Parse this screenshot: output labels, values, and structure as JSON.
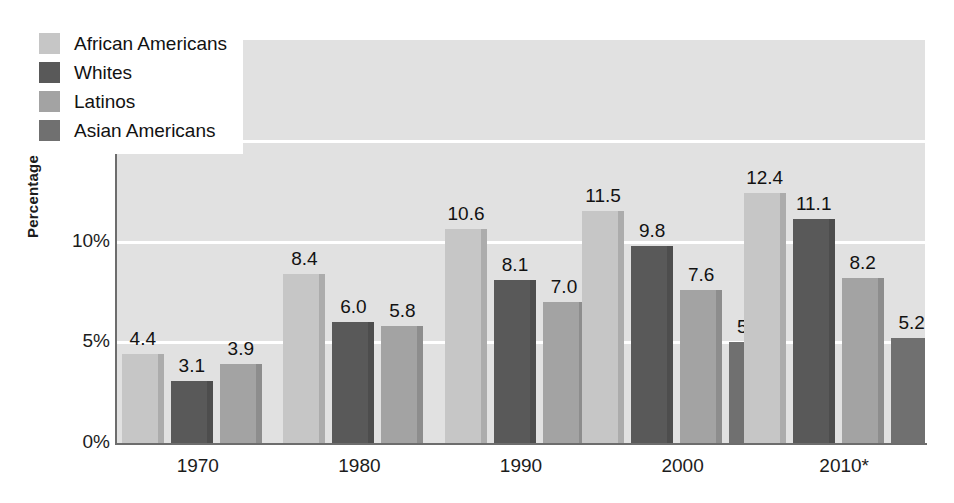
{
  "chart_data": {
    "type": "bar",
    "title": "",
    "subtitle": "",
    "xlabel": "",
    "ylabel": "Percentage",
    "categories": [
      "1970",
      "1980",
      "1990",
      "2000",
      "2010*"
    ],
    "ylim": [
      0,
      20
    ],
    "ytick_values": [
      0,
      5,
      10,
      15,
      20
    ],
    "ytick_labels": [
      "0%",
      "5%",
      "10%",
      "15%",
      "20%"
    ],
    "grid": "horizontal-white-gridlines",
    "legend_position": "top-left-inside",
    "value_label_format": "one-decimal",
    "series": [
      {
        "name": "African Americans",
        "color": "#c6c6c6",
        "values": [
          4.4,
          8.4,
          10.6,
          11.5,
          12.4
        ],
        "labels": [
          "4.4",
          "8.4",
          "10.6",
          "11.5",
          "12.4"
        ]
      },
      {
        "name": "Whites",
        "color": "#595959",
        "values": [
          3.1,
          6.0,
          8.1,
          9.8,
          11.1
        ],
        "labels": [
          "3.1",
          "6.0",
          "8.1",
          "9.8",
          "11.1"
        ]
      },
      {
        "name": "Latinos",
        "color": "#a3a3a3",
        "values": [
          3.9,
          5.8,
          7.0,
          7.6,
          8.2
        ],
        "labels": [
          "3.9",
          "5.8",
          "7.0",
          "7.6",
          "8.2"
        ]
      },
      {
        "name": "Asian Americans",
        "color": "#707070",
        "values": [
          null,
          null,
          null,
          5.0,
          5.2
        ],
        "labels": [
          "",
          "",
          "",
          "5.0",
          "5.2"
        ]
      }
    ]
  },
  "axes": {
    "y_title": "Percentage",
    "y_ticks": [
      "20%",
      "15%",
      "10%",
      "5%",
      "0%"
    ],
    "x_ticks": [
      "1970",
      "1980",
      "1990",
      "2000",
      "2010*"
    ]
  },
  "legend": {
    "items": [
      {
        "label": "African Americans",
        "color": "#c6c6c6"
      },
      {
        "label": "Whites",
        "color": "#595959"
      },
      {
        "label": "Latinos",
        "color": "#a3a3a3"
      },
      {
        "label": "Asian Americans",
        "color": "#707070"
      }
    ]
  },
  "colors": {
    "plot_background": "#e1e1e1",
    "gridline": "#ffffff",
    "axis_line": "#6d6d6d",
    "text": "#1c1c1c",
    "legend_background": "#ffffff"
  }
}
